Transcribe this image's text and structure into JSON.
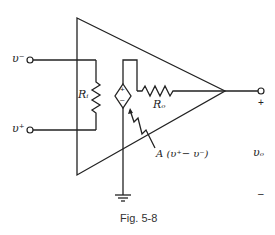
{
  "figure": {
    "caption": "Fig. 5-8",
    "labels": {
      "v_minus": "υ⁻",
      "v_plus": "υ⁺",
      "r_in": "Rᵢ",
      "r_out": "Rₒ",
      "gain_expr": "A (υ⁺− υ⁻)",
      "v_out": "υₒ",
      "out_plus": "+",
      "out_minus": "–",
      "src_plus": "+",
      "src_minus": "–"
    },
    "components": [
      {
        "type": "op-amp-triangle"
      },
      {
        "type": "resistor",
        "name": "Ri"
      },
      {
        "type": "resistor",
        "name": "Ro"
      },
      {
        "type": "dependent-voltage-source",
        "value": "A(v+ - v-)"
      },
      {
        "type": "ground"
      }
    ],
    "colors": {
      "line": "#222222",
      "background": "#ffffff"
    }
  }
}
